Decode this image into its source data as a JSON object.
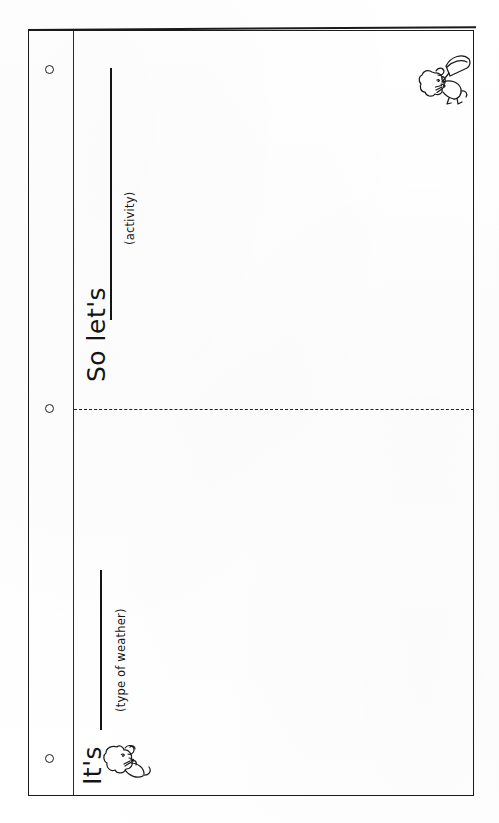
{
  "document": {
    "type": "handwriting-worksheet-scan",
    "orientation": "landscape-page-rotated-90-ccw",
    "page_color": "#ffffff",
    "ink_color": "#151515"
  },
  "page": {
    "holes": [
      {
        "name": "hole-top",
        "label": "o"
      },
      {
        "name": "hole-middle",
        "label": "o"
      },
      {
        "name": "hole-bottom",
        "label": "o"
      }
    ],
    "margin_rule": {
      "label": "margin rule"
    },
    "fold_line": {
      "label": "dashed fold line",
      "style": "dashed"
    }
  },
  "sections": [
    {
      "id": "section-top",
      "prompt": "So let's",
      "hint": "(activity)",
      "blank": "______________________",
      "doodle": "mouse-with-umbrella-doodle"
    },
    {
      "id": "section-bottom",
      "prompt": "It's",
      "hint": "(type of weather)",
      "blank": "______________________",
      "doodle": "mouse-doodle"
    }
  ]
}
